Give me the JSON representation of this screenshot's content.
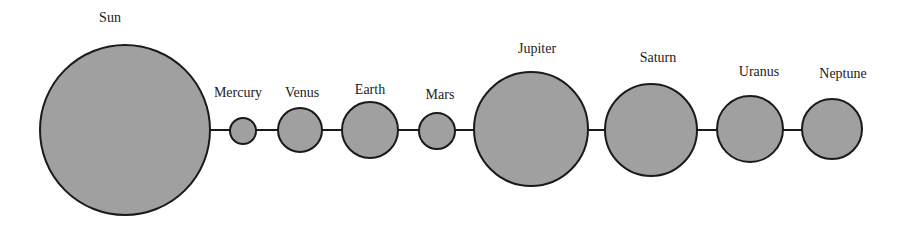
{
  "diagram": {
    "title": "",
    "colors": {
      "fill": "#a0a0a0",
      "stroke": "#1a1a1a",
      "background": "#ffffff",
      "text": "#222222"
    },
    "bodies": [
      {
        "name": "Sun",
        "cx": 125,
        "cy": 130,
        "r": 85,
        "label_x": 110,
        "label_y": 22
      },
      {
        "name": "Mercury",
        "cx": 243,
        "cy": 131,
        "r": 13,
        "label_x": 238,
        "label_y": 97
      },
      {
        "name": "Venus",
        "cx": 300,
        "cy": 130,
        "r": 22,
        "label_x": 302,
        "label_y": 97
      },
      {
        "name": "Earth",
        "cx": 370,
        "cy": 130,
        "r": 28,
        "label_x": 370,
        "label_y": 94
      },
      {
        "name": "Mars",
        "cx": 437,
        "cy": 131,
        "r": 18,
        "label_x": 440,
        "label_y": 99
      },
      {
        "name": "Jupiter",
        "cx": 531,
        "cy": 129,
        "r": 57,
        "label_x": 537,
        "label_y": 53
      },
      {
        "name": "Saturn",
        "cx": 651,
        "cy": 130,
        "r": 46,
        "label_x": 658,
        "label_y": 62
      },
      {
        "name": "Uranus",
        "cx": 750,
        "cy": 129,
        "r": 33,
        "label_x": 759,
        "label_y": 76
      },
      {
        "name": "Neptune",
        "cx": 832,
        "cy": 129,
        "r": 30,
        "label_x": 843,
        "label_y": 78
      }
    ]
  }
}
